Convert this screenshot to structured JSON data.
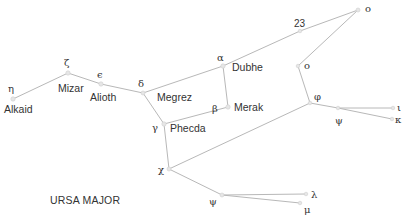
{
  "diagram": {
    "title": "URSA MAJOR",
    "colors": {
      "line": "#b8b8b8",
      "star": "#e6e6e6",
      "text": "#333333",
      "background": "#ffffff"
    },
    "stars": [
      {
        "id": "eta",
        "greek": "η",
        "name": "Alkaid",
        "x": 13,
        "y": 99
      },
      {
        "id": "zeta",
        "greek": "ζ",
        "name": "Mizar",
        "x": 68,
        "y": 73
      },
      {
        "id": "epsilon",
        "greek": "ε",
        "name": "Alioth",
        "x": 101,
        "y": 84
      },
      {
        "id": "delta",
        "greek": "δ",
        "name": "Megrez",
        "x": 143,
        "y": 93
      },
      {
        "id": "alpha",
        "greek": "α",
        "name": "Dubhe",
        "x": 223,
        "y": 66
      },
      {
        "id": "beta",
        "greek": "β",
        "name": "Merak",
        "x": 228,
        "y": 107
      },
      {
        "id": "gamma",
        "greek": "γ",
        "name": "Phecda",
        "x": 164,
        "y": 124
      },
      {
        "id": "s23",
        "greek": "23",
        "name": "",
        "x": 300,
        "y": 31
      },
      {
        "id": "omicron1",
        "greek": "ο",
        "name": "",
        "x": 358,
        "y": 10
      },
      {
        "id": "omicron2",
        "greek": "ο",
        "name": "",
        "x": 298,
        "y": 66
      },
      {
        "id": "phi",
        "greek": "φ",
        "name": "",
        "x": 310,
        "y": 103
      },
      {
        "id": "psi1",
        "greek": "ψ",
        "name": "",
        "x": 338,
        "y": 108
      },
      {
        "id": "iota",
        "greek": "ι",
        "name": "",
        "x": 393,
        "y": 108
      },
      {
        "id": "kappa",
        "greek": "κ",
        "name": "",
        "x": 392,
        "y": 119
      },
      {
        "id": "chi",
        "greek": "χ",
        "name": "",
        "x": 169,
        "y": 169
      },
      {
        "id": "psi2",
        "greek": "ψ",
        "name": "",
        "x": 222,
        "y": 195
      },
      {
        "id": "lambda",
        "greek": "λ",
        "name": "",
        "x": 306,
        "y": 194
      },
      {
        "id": "mu",
        "greek": "μ",
        "name": "",
        "x": 300,
        "y": 203
      }
    ],
    "labels": {
      "eta": {
        "greek": "η",
        "name": "Alkaid"
      },
      "zeta": {
        "greek": "ζ",
        "name": "Mizar"
      },
      "epsilon": {
        "greek": "ϵ",
        "name": "Alioth"
      },
      "delta": {
        "greek": "δ",
        "name": "Megrez"
      },
      "alpha": {
        "greek": "α",
        "name": "Dubhe"
      },
      "beta": {
        "greek": "β",
        "name": "Merak"
      },
      "gamma": {
        "greek": "γ",
        "name": "Phecda"
      },
      "s23": {
        "greek": "23"
      },
      "omicron1": {
        "greek": "ο"
      },
      "omicron2": {
        "greek": "ο"
      },
      "phi": {
        "greek": "φ"
      },
      "psi1": {
        "greek": "ψ"
      },
      "iota": {
        "greek": "ι"
      },
      "kappa": {
        "greek": "κ"
      },
      "chi": {
        "greek": "χ"
      },
      "psi2": {
        "greek": "ψ"
      },
      "lambda": {
        "greek": "λ"
      },
      "mu": {
        "greek": "μ"
      }
    },
    "connections": [
      [
        "eta",
        "zeta"
      ],
      [
        "zeta",
        "epsilon"
      ],
      [
        "epsilon",
        "delta"
      ],
      [
        "delta",
        "alpha"
      ],
      [
        "alpha",
        "beta"
      ],
      [
        "beta",
        "gamma"
      ],
      [
        "gamma",
        "delta"
      ],
      [
        "alpha",
        "s23"
      ],
      [
        "s23",
        "omicron1"
      ],
      [
        "omicron1",
        "omicron2"
      ],
      [
        "omicron2",
        "phi"
      ],
      [
        "phi",
        "psi1"
      ],
      [
        "psi1",
        "iota"
      ],
      [
        "psi1",
        "kappa"
      ],
      [
        "phi",
        "chi"
      ],
      [
        "gamma",
        "chi"
      ],
      [
        "chi",
        "psi2"
      ],
      [
        "psi2",
        "lambda"
      ],
      [
        "psi2",
        "mu"
      ]
    ]
  }
}
